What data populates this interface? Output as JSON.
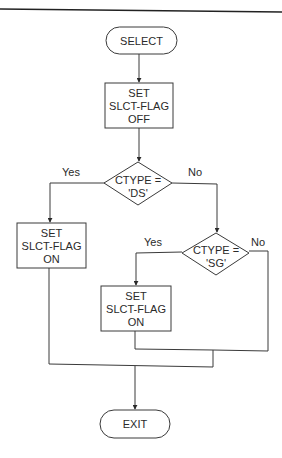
{
  "diagram": {
    "type": "flowchart",
    "nodes": {
      "start": {
        "kind": "terminal",
        "text": "SELECT"
      },
      "set_off": {
        "kind": "process",
        "lines": [
          "SET",
          "SLCT-FLAG",
          "OFF"
        ]
      },
      "decision_ds": {
        "kind": "decision",
        "lines": [
          "CTYPE =",
          "'DS'"
        ]
      },
      "set_on_left": {
        "kind": "process",
        "lines": [
          "SET",
          "SLCT-FLAG",
          "ON"
        ]
      },
      "decision_sg": {
        "kind": "decision",
        "lines": [
          "CTYPE =",
          "'SG'"
        ]
      },
      "set_on_right": {
        "kind": "process",
        "lines": [
          "SET",
          "SLCT-FLAG",
          "ON"
        ]
      },
      "end": {
        "kind": "terminal",
        "text": "EXIT"
      }
    },
    "edge_labels": {
      "ds_yes": "Yes",
      "ds_no": "No",
      "sg_yes": "Yes",
      "sg_no": "No"
    },
    "edges": [
      {
        "from": "start",
        "to": "set_off"
      },
      {
        "from": "set_off",
        "to": "decision_ds"
      },
      {
        "from": "decision_ds",
        "to": "set_on_left",
        "label": "Yes"
      },
      {
        "from": "decision_ds",
        "to": "decision_sg",
        "label": "No"
      },
      {
        "from": "decision_sg",
        "to": "set_on_right",
        "label": "Yes"
      },
      {
        "from": "decision_sg",
        "to": "end",
        "label": "No"
      },
      {
        "from": "set_on_right",
        "to": "end"
      },
      {
        "from": "set_on_left",
        "to": "end"
      }
    ]
  }
}
